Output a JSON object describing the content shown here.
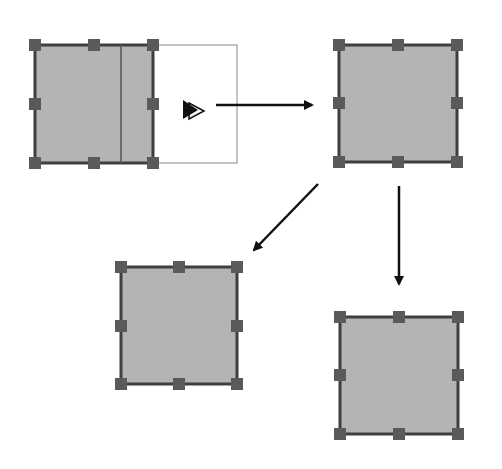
{
  "diagram": {
    "colors": {
      "shape_fill": "#b4b4b4",
      "shape_stroke": "#3f3f3f",
      "handle_fill": "#5a5a5a",
      "arrow": "#111111",
      "ghost_outline": "#8a8a8a",
      "background": "#ffffff"
    },
    "shapes": [
      {
        "id": "source-shape",
        "x": 35,
        "y": 45,
        "w": 118,
        "h": 118,
        "inner_line_x": 121,
        "ghost_right_edge": 237
      },
      {
        "id": "result-shape-top-right",
        "x": 339,
        "y": 45,
        "w": 118,
        "h": 117
      },
      {
        "id": "result-shape-bottom-left",
        "x": 121,
        "y": 267,
        "w": 116,
        "h": 117
      },
      {
        "id": "result-shape-bottom-right",
        "x": 340,
        "y": 317,
        "w": 118,
        "h": 117
      }
    ],
    "arrows": [
      {
        "id": "arrow-right",
        "x1": 216,
        "y1": 105,
        "x2": 312,
        "y2": 105
      },
      {
        "id": "arrow-down-left",
        "x1": 318,
        "y1": 184,
        "x2": 252,
        "y2": 252
      },
      {
        "id": "arrow-down",
        "x1": 399,
        "y1": 186,
        "x2": 399,
        "y2": 286
      }
    ],
    "cursor": {
      "icon": "resize-drag-cursor-icon",
      "x": 182,
      "y": 99
    }
  }
}
